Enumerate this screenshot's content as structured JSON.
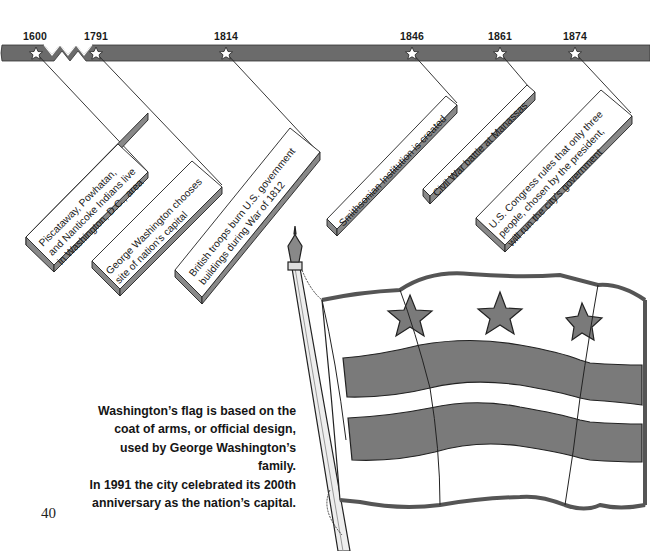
{
  "timeline": {
    "bar_color": "#6b6b6b",
    "events": [
      {
        "year": "1600",
        "text_lines": [
          "Piscataway, Powhatan,",
          "and Nanticoke Indians live",
          "in Washington, D.C., area"
        ]
      },
      {
        "year": "1791",
        "text_lines": [
          "George Washington chooses",
          "site of nation’s capital"
        ]
      },
      {
        "year": "1814",
        "text_lines": [
          "British troops burn U.S. government",
          "buildings during War of 1812"
        ]
      },
      {
        "year": "1846",
        "text_lines": [
          "Smithsonian Institution is created"
        ]
      },
      {
        "year": "1861",
        "text_lines": [
          "Civil War battle at Manassas"
        ]
      },
      {
        "year": "1874",
        "text_lines": [
          "U.S. Congress rules that only three",
          "people, chosen by the president,",
          "will run the city’s government"
        ]
      }
    ]
  },
  "caption": {
    "lines": [
      "Washington’s flag is based on the",
      "coat of arms, or official design,",
      "used by George Washington’s family.",
      "In 1991 the city celebrated its 200th",
      "anniversary as the nation’s capital."
    ]
  },
  "illustration": {
    "subject": "Washington, D.C. flag on pole",
    "stars": 3,
    "stripes": 2,
    "fill_color": "#7a7a7a"
  },
  "page_number": "40"
}
